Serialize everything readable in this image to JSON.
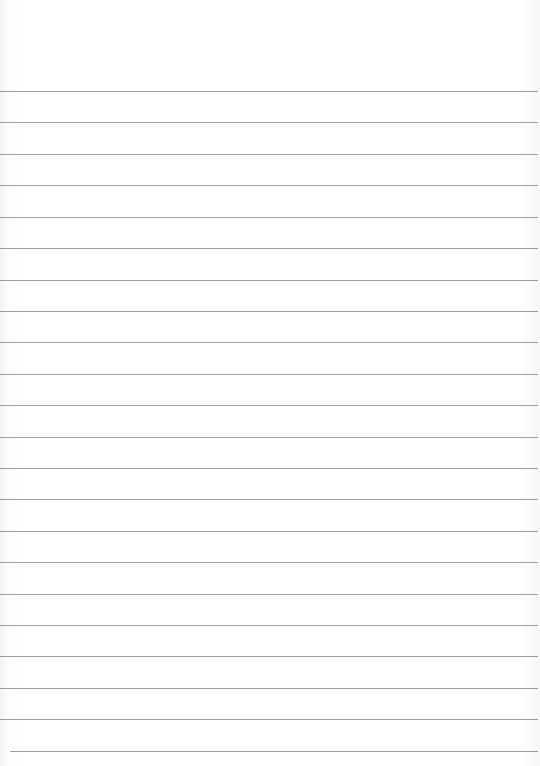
{
  "page": {
    "type": "lined-paper",
    "background_color": "#ffffff",
    "line_color": "#8e8e8e",
    "line_count": 22,
    "first_line_y": 91,
    "line_spacing": 31.43,
    "lines": [
      {
        "y": 91,
        "x": 0,
        "w": 538
      },
      {
        "y": 122,
        "x": 0,
        "w": 538
      },
      {
        "y": 154,
        "x": 0,
        "w": 538
      },
      {
        "y": 185,
        "x": 0,
        "w": 538
      },
      {
        "y": 217,
        "x": 0,
        "w": 538
      },
      {
        "y": 248,
        "x": 0,
        "w": 538
      },
      {
        "y": 280,
        "x": 0,
        "w": 538
      },
      {
        "y": 311,
        "x": 0,
        "w": 538
      },
      {
        "y": 342,
        "x": 0,
        "w": 538
      },
      {
        "y": 374,
        "x": 0,
        "w": 538
      },
      {
        "y": 405,
        "x": 0,
        "w": 538
      },
      {
        "y": 437,
        "x": 0,
        "w": 538
      },
      {
        "y": 468,
        "x": 0,
        "w": 538
      },
      {
        "y": 499,
        "x": 0,
        "w": 538
      },
      {
        "y": 531,
        "x": 0,
        "w": 538
      },
      {
        "y": 562,
        "x": 0,
        "w": 538
      },
      {
        "y": 594,
        "x": 0,
        "w": 538
      },
      {
        "y": 625,
        "x": 0,
        "w": 538
      },
      {
        "y": 656,
        "x": 0,
        "w": 538
      },
      {
        "y": 688,
        "x": 0,
        "w": 538
      },
      {
        "y": 719,
        "x": 0,
        "w": 538
      },
      {
        "y": 751,
        "x": 10,
        "w": 528
      }
    ]
  }
}
